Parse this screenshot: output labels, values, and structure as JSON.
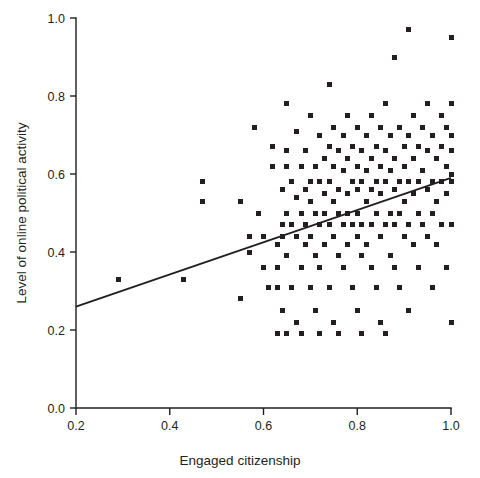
{
  "chart_data": {
    "type": "scatter",
    "title": "",
    "xlabel": "Engaged citizenship",
    "ylabel": "Level of online political activity",
    "xlim": [
      0.2,
      1.0
    ],
    "ylim": [
      0.0,
      1.0
    ],
    "xticks": [
      0.2,
      0.4,
      0.6,
      0.8,
      1.0
    ],
    "yticks": [
      0.0,
      0.2,
      0.4,
      0.6,
      0.8,
      1.0
    ],
    "xtick_labels": [
      "0.2",
      "0.4",
      "0.6",
      "0.8",
      "1.0"
    ],
    "ytick_labels": [
      "0.0",
      "0.2",
      "0.4",
      "0.6",
      "0.8",
      "1.0"
    ],
    "grid": false,
    "legend": "none",
    "marker": "square",
    "marker_color": "#231f20",
    "marker_size_px": 5,
    "trendline": {
      "type": "linear-fit",
      "x": [
        0.2,
        1.0
      ],
      "y": [
        0.26,
        0.59
      ],
      "color": "#231f20"
    },
    "points": [
      [
        0.29,
        0.33
      ],
      [
        0.43,
        0.33
      ],
      [
        0.47,
        0.58
      ],
      [
        0.47,
        0.53
      ],
      [
        0.55,
        0.53
      ],
      [
        0.55,
        0.28
      ],
      [
        0.57,
        0.44
      ],
      [
        0.57,
        0.4
      ],
      [
        0.58,
        0.72
      ],
      [
        0.59,
        0.5
      ],
      [
        0.6,
        0.44
      ],
      [
        0.6,
        0.36
      ],
      [
        0.61,
        0.31
      ],
      [
        0.62,
        0.62
      ],
      [
        0.62,
        0.67
      ],
      [
        0.63,
        0.42
      ],
      [
        0.63,
        0.36
      ],
      [
        0.63,
        0.31
      ],
      [
        0.63,
        0.19
      ],
      [
        0.64,
        0.56
      ],
      [
        0.64,
        0.47
      ],
      [
        0.64,
        0.44
      ],
      [
        0.64,
        0.25
      ],
      [
        0.65,
        0.78
      ],
      [
        0.65,
        0.66
      ],
      [
        0.65,
        0.62
      ],
      [
        0.65,
        0.5
      ],
      [
        0.65,
        0.39
      ],
      [
        0.65,
        0.19
      ],
      [
        0.66,
        0.58
      ],
      [
        0.66,
        0.47
      ],
      [
        0.66,
        0.31
      ],
      [
        0.67,
        0.71
      ],
      [
        0.67,
        0.54
      ],
      [
        0.67,
        0.44
      ],
      [
        0.67,
        0.22
      ],
      [
        0.68,
        0.62
      ],
      [
        0.68,
        0.5
      ],
      [
        0.68,
        0.36
      ],
      [
        0.68,
        0.19
      ],
      [
        0.69,
        0.66
      ],
      [
        0.69,
        0.56
      ],
      [
        0.69,
        0.47
      ],
      [
        0.69,
        0.42
      ],
      [
        0.7,
        0.75
      ],
      [
        0.7,
        0.58
      ],
      [
        0.7,
        0.53
      ],
      [
        0.7,
        0.44
      ],
      [
        0.7,
        0.31
      ],
      [
        0.71,
        0.62
      ],
      [
        0.71,
        0.5
      ],
      [
        0.71,
        0.39
      ],
      [
        0.71,
        0.25
      ],
      [
        0.72,
        0.7
      ],
      [
        0.72,
        0.58
      ],
      [
        0.72,
        0.47
      ],
      [
        0.72,
        0.36
      ],
      [
        0.72,
        0.19
      ],
      [
        0.73,
        0.64
      ],
      [
        0.73,
        0.55
      ],
      [
        0.73,
        0.5
      ],
      [
        0.73,
        0.42
      ],
      [
        0.74,
        0.83
      ],
      [
        0.74,
        0.67
      ],
      [
        0.74,
        0.58
      ],
      [
        0.74,
        0.47
      ],
      [
        0.74,
        0.31
      ],
      [
        0.75,
        0.72
      ],
      [
        0.75,
        0.62
      ],
      [
        0.75,
        0.53
      ],
      [
        0.75,
        0.44
      ],
      [
        0.75,
        0.22
      ],
      [
        0.76,
        0.66
      ],
      [
        0.76,
        0.56
      ],
      [
        0.76,
        0.5
      ],
      [
        0.76,
        0.39
      ],
      [
        0.76,
        0.19
      ],
      [
        0.77,
        0.7
      ],
      [
        0.77,
        0.61
      ],
      [
        0.77,
        0.47
      ],
      [
        0.77,
        0.36
      ],
      [
        0.78,
        0.75
      ],
      [
        0.78,
        0.64
      ],
      [
        0.78,
        0.55
      ],
      [
        0.78,
        0.5
      ],
      [
        0.78,
        0.42
      ],
      [
        0.79,
        0.67
      ],
      [
        0.79,
        0.58
      ],
      [
        0.79,
        0.47
      ],
      [
        0.79,
        0.31
      ],
      [
        0.8,
        0.72
      ],
      [
        0.8,
        0.62
      ],
      [
        0.8,
        0.56
      ],
      [
        0.8,
        0.5
      ],
      [
        0.8,
        0.44
      ],
      [
        0.8,
        0.25
      ],
      [
        0.81,
        0.66
      ],
      [
        0.81,
        0.58
      ],
      [
        0.81,
        0.47
      ],
      [
        0.81,
        0.39
      ],
      [
        0.81,
        0.19
      ],
      [
        0.82,
        0.7
      ],
      [
        0.82,
        0.61
      ],
      [
        0.82,
        0.53
      ],
      [
        0.82,
        0.42
      ],
      [
        0.83,
        0.75
      ],
      [
        0.83,
        0.64
      ],
      [
        0.83,
        0.56
      ],
      [
        0.83,
        0.47
      ],
      [
        0.83,
        0.36
      ],
      [
        0.84,
        0.67
      ],
      [
        0.84,
        0.58
      ],
      [
        0.84,
        0.5
      ],
      [
        0.84,
        0.31
      ],
      [
        0.85,
        0.72
      ],
      [
        0.85,
        0.62
      ],
      [
        0.85,
        0.55
      ],
      [
        0.85,
        0.44
      ],
      [
        0.85,
        0.22
      ],
      [
        0.86,
        0.78
      ],
      [
        0.86,
        0.66
      ],
      [
        0.86,
        0.58
      ],
      [
        0.86,
        0.47
      ],
      [
        0.86,
        0.19
      ],
      [
        0.87,
        0.7
      ],
      [
        0.87,
        0.61
      ],
      [
        0.87,
        0.5
      ],
      [
        0.87,
        0.39
      ],
      [
        0.88,
        0.9
      ],
      [
        0.88,
        0.64
      ],
      [
        0.88,
        0.56
      ],
      [
        0.88,
        0.47
      ],
      [
        0.88,
        0.36
      ],
      [
        0.89,
        0.72
      ],
      [
        0.89,
        0.58
      ],
      [
        0.89,
        0.5
      ],
      [
        0.89,
        0.31
      ],
      [
        0.9,
        0.67
      ],
      [
        0.9,
        0.62
      ],
      [
        0.9,
        0.53
      ],
      [
        0.9,
        0.44
      ],
      [
        0.91,
        0.97
      ],
      [
        0.91,
        0.7
      ],
      [
        0.91,
        0.58
      ],
      [
        0.91,
        0.47
      ],
      [
        0.91,
        0.25
      ],
      [
        0.92,
        0.75
      ],
      [
        0.92,
        0.64
      ],
      [
        0.92,
        0.55
      ],
      [
        0.92,
        0.42
      ],
      [
        0.93,
        0.67
      ],
      [
        0.93,
        0.58
      ],
      [
        0.93,
        0.5
      ],
      [
        0.93,
        0.36
      ],
      [
        0.94,
        0.72
      ],
      [
        0.94,
        0.61
      ],
      [
        0.94,
        0.47
      ],
      [
        0.95,
        0.78
      ],
      [
        0.95,
        0.66
      ],
      [
        0.95,
        0.56
      ],
      [
        0.95,
        0.44
      ],
      [
        0.96,
        0.7
      ],
      [
        0.96,
        0.58
      ],
      [
        0.96,
        0.5
      ],
      [
        0.96,
        0.31
      ],
      [
        0.97,
        0.64
      ],
      [
        0.97,
        0.53
      ],
      [
        0.97,
        0.42
      ],
      [
        0.98,
        0.75
      ],
      [
        0.98,
        0.67
      ],
      [
        0.98,
        0.58
      ],
      [
        0.98,
        0.47
      ],
      [
        0.99,
        0.72
      ],
      [
        0.99,
        0.62
      ],
      [
        0.99,
        0.55
      ],
      [
        0.99,
        0.36
      ],
      [
        1.0,
        0.95
      ],
      [
        1.0,
        0.78
      ],
      [
        1.0,
        0.7
      ],
      [
        1.0,
        0.66
      ],
      [
        1.0,
        0.6
      ],
      [
        1.0,
        0.58
      ],
      [
        1.0,
        0.47
      ],
      [
        1.0,
        0.22
      ]
    ]
  }
}
